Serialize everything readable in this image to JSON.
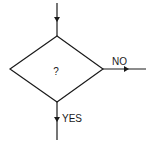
{
  "diagram": {
    "type": "flowchart-decision",
    "decision": {
      "label": "?"
    },
    "branches": {
      "no": {
        "label": "NO"
      },
      "yes": {
        "label": "YES"
      }
    },
    "colors": {
      "stroke": "#1a1a1a",
      "background": "#ffffff"
    }
  }
}
